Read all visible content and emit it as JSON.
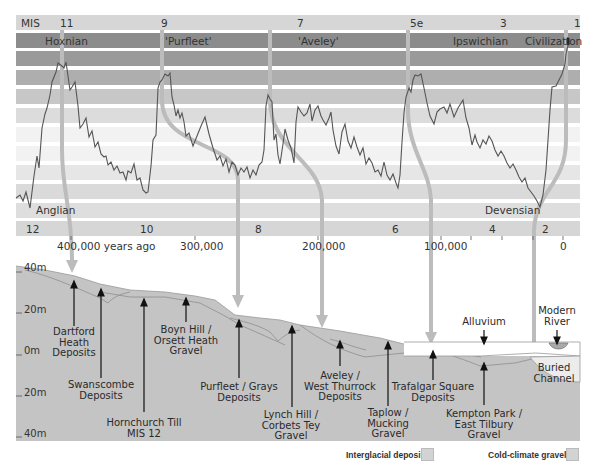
{
  "mis_row": {
    "label": "MIS",
    "stages": [
      {
        "label": "11",
        "x": 62
      },
      {
        "label": "9",
        "x": 162
      },
      {
        "label": "7",
        "x": 270
      },
      {
        "label": "5e",
        "x": 412
      },
      {
        "label": "3",
        "x": 502
      },
      {
        "label": "1",
        "x": 576
      }
    ]
  },
  "interglacial_row": {
    "names": [
      {
        "label": "Hoxnian",
        "x": 45
      },
      {
        "label": "'Purfleet'",
        "x": 165
      },
      {
        "label": "'Aveley'",
        "x": 298
      },
      {
        "label": "Ipswichian",
        "x": 453
      },
      {
        "label": "Civilization",
        "x": 525
      }
    ]
  },
  "glacial_labels": [
    {
      "label": "Anglian",
      "x": 36,
      "y": 206
    },
    {
      "label": "Devensian",
      "x": 485,
      "y": 206
    }
  ],
  "bottom_mis_row": {
    "stages": [
      {
        "label": "12",
        "x": 28
      },
      {
        "label": "10",
        "x": 142
      },
      {
        "label": "8",
        "x": 257
      },
      {
        "label": "6",
        "x": 393
      },
      {
        "label": "4",
        "x": 490
      },
      {
        "label": "2",
        "x": 543
      }
    ]
  },
  "time_axis": {
    "ticks": [
      {
        "label": "400,000 years ago",
        "x": 57
      },
      {
        "label": "300,000",
        "x": 180
      },
      {
        "label": "200,000",
        "x": 302
      },
      {
        "label": "100,000",
        "x": 424
      },
      {
        "label": "0",
        "x": 562
      }
    ]
  },
  "depth_axis": {
    "labels": [
      {
        "label": "40m",
        "y": 266
      },
      {
        "label": "20m",
        "y": 308
      },
      {
        "label": "0m",
        "y": 349
      },
      {
        "label": "20m",
        "y": 391
      },
      {
        "label": "40m",
        "y": 432
      }
    ]
  },
  "deposits": [
    {
      "label": "Dartford\nHeath\nDeposits",
      "x": 82,
      "y": 327
    },
    {
      "label": "Swanscombe\nDeposits",
      "x": 101,
      "y": 380
    },
    {
      "label": "Hornchurch Till\nMIS 12",
      "x": 144,
      "y": 418
    },
    {
      "label": "Boyn Hill /\nOrsett Heath\nGravel",
      "x": 186,
      "y": 325
    },
    {
      "label": "Purfleet / Grays\nDeposits",
      "x": 239,
      "y": 382
    },
    {
      "label": "Lynch Hill /\nCorbets Tey\nGravel",
      "x": 291,
      "y": 410
    },
    {
      "label": "Aveley /\nWest Thurrock\nDeposits",
      "x": 340,
      "y": 371
    },
    {
      "label": "Taplow /\nMucking\nGravel",
      "x": 388,
      "y": 408
    },
    {
      "label": "Trafalgar Square\nDeposits",
      "x": 433,
      "y": 382
    },
    {
      "label": "Kempton Park /\nEast Tilbury\nGravel",
      "x": 485,
      "y": 409
    },
    {
      "label": "Alluvium",
      "x": 484,
      "y": 317
    },
    {
      "label": "Modern\nRiver",
      "x": 557,
      "y": 306
    },
    {
      "label": "Buried\nChannel",
      "x": 553,
      "y": 363
    }
  ],
  "legend": {
    "interglacial": "Interglacial deposits",
    "cold": "Cold-climate gravels"
  },
  "colors": {
    "band_dark": "#8a8a8a",
    "band_mid": "#a6a6a6",
    "band_light": "#c9c9c9",
    "band_faint": "#e6e6e6",
    "arrow": "#bdbdbd",
    "section_fill": "#c4c4c4",
    "curve": "#555555"
  }
}
